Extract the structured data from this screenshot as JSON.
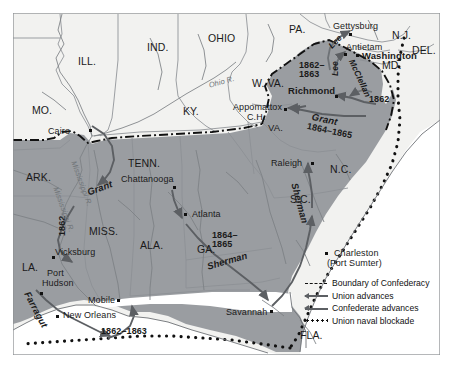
{
  "map": {
    "title": "Civil War Campaign Map",
    "colors": {
      "confederacy_fill": "#9a9da1",
      "union_fill": "#f2f2f0",
      "ocean_fill": "#ffffff",
      "state_border": "#8d9095",
      "confederacy_boundary": "#111111",
      "advance_arrow": "#5c5f63",
      "blockade_dot": "#111111",
      "frame": "#8e9194",
      "river": "#7d8185",
      "label_text": "#1a1a1a"
    },
    "union_states": [
      {
        "label": "ILL.",
        "x": 78,
        "y": 56
      },
      {
        "label": "IND.",
        "x": 147,
        "y": 42
      },
      {
        "label": "OHIO",
        "x": 208,
        "y": 33
      },
      {
        "label": "PA.",
        "x": 289,
        "y": 24
      },
      {
        "label": "N.J.",
        "x": 392,
        "y": 30
      },
      {
        "label": "DEL.",
        "x": 412,
        "y": 45
      },
      {
        "label": "MO.",
        "x": 32,
        "y": 105
      },
      {
        "label": "KY.",
        "x": 183,
        "y": 106
      },
      {
        "label": "W. VA.",
        "x": 252,
        "y": 78
      },
      {
        "label": "MD.",
        "x": 382,
        "y": 60
      }
    ],
    "confederate_states": [
      {
        "label": "ARK.",
        "x": 26,
        "y": 172
      },
      {
        "label": "TENN.",
        "x": 128,
        "y": 158
      },
      {
        "label": "N.C.",
        "x": 330,
        "y": 164
      },
      {
        "label": "S.C.",
        "x": 290,
        "y": 194
      },
      {
        "label": "MISS.",
        "x": 89,
        "y": 226
      },
      {
        "label": "ALA.",
        "x": 140,
        "y": 240
      },
      {
        "label": "GA.",
        "x": 197,
        "y": 244
      },
      {
        "label": "LA.",
        "x": 22,
        "y": 262
      },
      {
        "label": "FLA.",
        "x": 300,
        "y": 330
      },
      {
        "label": "VA.",
        "x": 268,
        "y": 123
      }
    ],
    "cities": [
      {
        "label": "Cairo",
        "x": 48,
        "y": 127,
        "bold": false,
        "dot_x": 89,
        "dot_y": 129
      },
      {
        "label": "Chattanooga",
        "x": 121,
        "y": 175,
        "bold": false,
        "dot_x": 173,
        "dot_y": 186
      },
      {
        "label": "Raleigh",
        "x": 271,
        "y": 159,
        "bold": false,
        "dot_x": 311,
        "dot_y": 162
      },
      {
        "label": "Atlanta",
        "x": 192,
        "y": 210,
        "bold": false,
        "dot_x": 184,
        "dot_y": 219
      },
      {
        "label": "Vicksburg",
        "x": 55,
        "y": 248,
        "bold": false,
        "dot_x": 52,
        "dot_y": 256
      },
      {
        "label": "Mobile",
        "x": 88,
        "y": 296,
        "bold": false,
        "dot_x": 117,
        "dot_y": 301
      },
      {
        "label": "New Orleans",
        "x": 63,
        "y": 317,
        "bold": false,
        "dot_x": 58,
        "dot_y": 317
      },
      {
        "label": "Savannah",
        "x": 226,
        "y": 314,
        "bold": false,
        "dot_x": 270,
        "dot_y": 312
      },
      {
        "label": "Gettysburg",
        "x": 333,
        "y": 22,
        "bold": false,
        "dot_x": 349,
        "dot_y": 33
      },
      {
        "label": "Antietam",
        "x": 346,
        "y": 43,
        "bold": false,
        "dot_x": 344,
        "dot_y": 53
      },
      {
        "label": "Appomattox",
        "x": 233,
        "y": 104,
        "bold": false,
        "dot_x": 284,
        "dot_y": 108
      },
      {
        "label": "C.H.",
        "x": 247,
        "y": 113,
        "bold": false,
        "dot_x": null,
        "dot_y": null
      },
      {
        "label": "Washington",
        "x": 362,
        "y": 53,
        "bold": true,
        "dot_x": 356,
        "dot_y": 54
      },
      {
        "label": "Richmond",
        "x": 290,
        "y": 88,
        "bold": true,
        "dot_x": 335,
        "dot_y": 95
      },
      {
        "label": "Charleston",
        "x": 336,
        "y": 256,
        "bold": false,
        "dot_x": 326,
        "dot_y": 254
      },
      {
        "label": "(Fort Sumter)",
        "x": 329,
        "y": 266,
        "bold": false,
        "dot_x": null,
        "dot_y": null
      },
      {
        "label": "Port",
        "x": 47,
        "y": 271,
        "bold": false,
        "dot_x": null,
        "dot_y": null
      },
      {
        "label": "Hudson",
        "x": 42,
        "y": 281,
        "bold": false,
        "dot_x": 40,
        "dot_y": 292
      }
    ],
    "commanders": [
      {
        "label": "Grant",
        "x": 86,
        "y": 180
      },
      {
        "label": "Grant",
        "x": 320,
        "y": 107
      },
      {
        "label": "Sherman",
        "x": 215,
        "y": 258
      },
      {
        "label": "Sherman",
        "x": 296,
        "y": 184
      },
      {
        "label": "Farragut",
        "x": 34,
        "y": 296
      },
      {
        "label": "Lee",
        "x": 330,
        "y": 36
      },
      {
        "label": "Lee",
        "x": 330,
        "y": 62
      },
      {
        "label": "McClellan",
        "x": 360,
        "y": 62
      }
    ],
    "year_labels": [
      {
        "label": "1862",
        "x": 55,
        "y": 222
      },
      {
        "label": "1862–1863",
        "x": 101,
        "y": 331
      },
      {
        "label": "1864–",
        "x": 213,
        "y": 233
      },
      {
        "label": "1865",
        "x": 213,
        "y": 242
      },
      {
        "label": "1862–",
        "x": 300,
        "y": 62
      },
      {
        "label": "1863",
        "x": 300,
        "y": 71
      },
      {
        "label": "1864–1865",
        "x": 313,
        "y": 120
      },
      {
        "label": "1862",
        "x": 370,
        "y": 97
      }
    ],
    "rivers": [
      {
        "label": "Ohio R.",
        "x": 212,
        "y": 78
      },
      {
        "label": "Mississippi R.",
        "x": 76,
        "y": 168
      },
      {
        "label": "Mississippi R.",
        "x": 58,
        "y": 192
      }
    ],
    "legend": {
      "items": [
        {
          "key": "dashed-line",
          "label": "Boundary of Confederacy"
        },
        {
          "key": "arrow-union",
          "label": "Union advances"
        },
        {
          "key": "arrow-confed",
          "label": "Confederate advances"
        },
        {
          "key": "dotted-line",
          "label": "Union naval blockade"
        }
      ]
    }
  }
}
